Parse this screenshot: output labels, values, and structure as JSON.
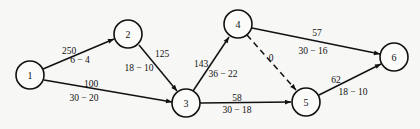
{
  "diagram": {
    "type": "network",
    "nodes": [
      {
        "id": "1",
        "label": "1",
        "x": 30,
        "y": 75
      },
      {
        "id": "2",
        "label": "2",
        "x": 128,
        "y": 34
      },
      {
        "id": "3",
        "label": "3",
        "x": 186,
        "y": 103
      },
      {
        "id": "4",
        "label": "4",
        "x": 238,
        "y": 24
      },
      {
        "id": "5",
        "label": "5",
        "x": 306,
        "y": 102
      },
      {
        "id": "6",
        "label": "6",
        "x": 394,
        "y": 57
      }
    ],
    "edges": [
      {
        "from": "1",
        "to": "2",
        "cost": "250",
        "time": "6 − 4",
        "dashed": false
      },
      {
        "from": "1",
        "to": "3",
        "cost": "100",
        "time": "30 − 20",
        "dashed": false
      },
      {
        "from": "2",
        "to": "3",
        "cost": "125",
        "time": "18 − 10",
        "dashed": false
      },
      {
        "from": "3",
        "to": "4",
        "cost": "143",
        "time": "36 − 22",
        "dashed": false
      },
      {
        "from": "3",
        "to": "5",
        "cost": "58",
        "time": "30 − 18",
        "dashed": false
      },
      {
        "from": "4",
        "to": "5",
        "cost": "0",
        "time": "",
        "dashed": true
      },
      {
        "from": "4",
        "to": "6",
        "cost": "57",
        "time": "30 − 16",
        "dashed": false
      },
      {
        "from": "5",
        "to": "6",
        "cost": "62",
        "time": "18 − 10",
        "dashed": false
      }
    ]
  },
  "labels": {
    "e12_cost": "250",
    "e12_time": "6 − 4",
    "e13_cost": "100",
    "e13_time": "30 − 20",
    "e23_cost": "125",
    "e23_time": "18 − 10",
    "e34_cost": "143",
    "e34_time": "36 − 22",
    "e35_cost": "58",
    "e35_time": "30 − 18",
    "e45_cost": "0",
    "e46_cost": "57",
    "e46_time": "30 − 16",
    "e56_cost": "62",
    "e56_time": "18 − 10",
    "n1": "1",
    "n2": "2",
    "n3": "3",
    "n4": "4",
    "n5": "5",
    "n6": "6"
  }
}
